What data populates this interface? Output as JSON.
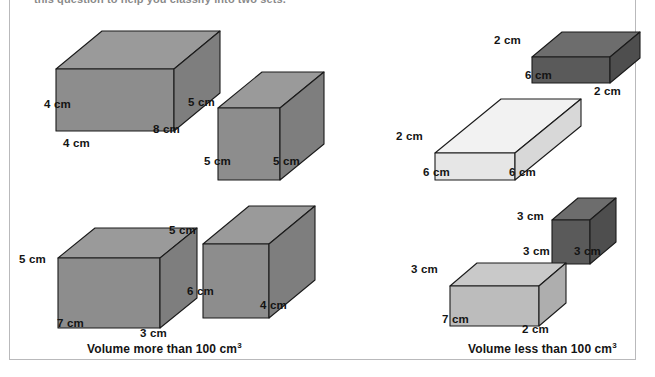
{
  "heading": {
    "clipped_text": "this question to help you classify into two sets."
  },
  "units": "cm",
  "colors": {
    "gray_top": "#9a9a9a",
    "gray_left": "#8d8d8d",
    "gray_right": "#7e7e7e",
    "dark_top": "#6d6d6d",
    "dark_left": "#5a5a5a",
    "dark_right": "#4e4e4e",
    "light_top": "#f2f2f2",
    "light_left": "#e6e6e6",
    "light_right": "#d8d8d8",
    "mid_top": "#c9c9c9",
    "mid_left": "#bcbcbc",
    "mid_right": "#aeaeae",
    "outline": "#1b1b1b",
    "frame": "#b9b9bb",
    "text": "#141414"
  },
  "groups": [
    {
      "id": "more-than-100",
      "caption": "Volume more than 100 cm",
      "caption_exponent": "3",
      "caption_x": 87,
      "caption_y": 341,
      "boxes": [
        {
          "id": "box-4x4x8",
          "name": "cuboid-4-4-8",
          "shade": "gray",
          "x": 30,
          "y": 14,
          "width": 175,
          "height": 120,
          "geom": {
            "w": 118,
            "h": 62,
            "dx": 46,
            "dy": -38
          },
          "origin": {
            "x": 26,
            "y": 55
          },
          "labels": [
            {
              "text": "4 cm",
              "x": 14,
              "y": 84
            },
            {
              "text": "4 cm",
              "x": 33,
              "y": 123
            },
            {
              "text": "8 cm",
              "x": 123,
              "y": 109
            }
          ]
        },
        {
          "id": "box-5x5x5",
          "name": "cube-5-5-5",
          "shade": "gray",
          "x": 194,
          "y": 46,
          "width": 135,
          "height": 130,
          "geom": {
            "w": 62,
            "h": 72,
            "dx": 44,
            "dy": -36
          },
          "origin": {
            "x": 24,
            "y": 62
          },
          "labels": [
            {
              "text": "5 cm",
              "x": -6,
              "y": 50
            },
            {
              "text": "5 cm",
              "x": 10,
              "y": 109
            },
            {
              "text": "5 cm",
              "x": 79,
              "y": 109
            }
          ]
        },
        {
          "id": "box-7x3x5",
          "name": "cuboid-7-3-5",
          "shade": "gray",
          "x": 30,
          "y": 200,
          "width": 170,
          "height": 140,
          "geom": {
            "w": 102,
            "h": 70,
            "dx": 37,
            "dy": -30
          },
          "origin": {
            "x": 28,
            "y": 58
          },
          "labels": [
            {
              "text": "5 cm",
              "x": -11,
              "y": 53
            },
            {
              "text": "7 cm",
              "x": 27,
              "y": 117
            },
            {
              "text": "3 cm",
              "x": 110,
              "y": 127
            }
          ]
        },
        {
          "id": "box-6x4x5",
          "name": "cuboid-6-4-5",
          "shade": "gray",
          "x": 178,
          "y": 182,
          "width": 150,
          "height": 145,
          "geom": {
            "w": 66,
            "h": 74,
            "dx": 46,
            "dy": -38
          },
          "origin": {
            "x": 25,
            "y": 62
          },
          "labels": [
            {
              "text": "5 cm",
              "x": -9,
              "y": 42
            },
            {
              "text": "6 cm",
              "x": 9,
              "y": 103
            },
            {
              "text": "4 cm",
              "x": 82,
              "y": 117
            }
          ]
        }
      ]
    },
    {
      "id": "less-than-100",
      "caption": "Volume less than 100 cm",
      "caption_exponent": "3",
      "caption_x": 468,
      "caption_y": 341,
      "boxes": [
        {
          "id": "box-6x2x2",
          "name": "cuboid-6-2-2",
          "shade": "dark",
          "x": 500,
          "y": 12,
          "width": 130,
          "height": 85,
          "geom": {
            "w": 78,
            "h": 26,
            "dx": 30,
            "dy": -25
          },
          "origin": {
            "x": 32,
            "y": 45
          },
          "labels": [
            {
              "text": "2 cm",
              "x": -6,
              "y": 22
            },
            {
              "text": "6 cm",
              "x": 25,
              "y": 57
            },
            {
              "text": "2 cm",
              "x": 94,
              "y": 73
            }
          ]
        },
        {
          "id": "box-6x6x2",
          "name": "cuboid-6-6-2",
          "shade": "light",
          "x": 410,
          "y": 80,
          "width": 180,
          "height": 95,
          "geom": {
            "w": 80,
            "h": 27,
            "dx": 66,
            "dy": -54
          },
          "origin": {
            "x": 25,
            "y": 73
          },
          "labels": [
            {
              "text": "2 cm",
              "x": -14,
              "y": 50
            },
            {
              "text": "6 cm",
              "x": 13,
              "y": 86
            },
            {
              "text": "6 cm",
              "x": 99,
              "y": 86
            }
          ]
        },
        {
          "id": "box-3x3x3",
          "name": "cube-3-3-3",
          "shade": "dark",
          "x": 528,
          "y": 178,
          "width": 110,
          "height": 85,
          "geom": {
            "w": 38,
            "h": 44,
            "dx": 26,
            "dy": -22
          },
          "origin": {
            "x": 24,
            "y": 42
          },
          "labels": [
            {
              "text": "3 cm",
              "x": -11,
              "y": 32
            },
            {
              "text": "3 cm",
              "x": -5,
              "y": 67
            },
            {
              "text": "3 cm",
              "x": 46,
              "y": 67
            }
          ]
        },
        {
          "id": "box-7x2x3",
          "name": "cuboid-7-2-3",
          "shade": "mid",
          "x": 420,
          "y": 226,
          "width": 150,
          "height": 110,
          "geom": {
            "w": 89,
            "h": 40,
            "dx": 27,
            "dy": -23
          },
          "origin": {
            "x": 30,
            "y": 60
          },
          "labels": [
            {
              "text": "3 cm",
              "x": -9,
              "y": 37
            },
            {
              "text": "7 cm",
              "x": 22,
              "y": 87
            },
            {
              "text": "2 cm",
              "x": 102,
              "y": 97
            }
          ]
        }
      ]
    }
  ]
}
